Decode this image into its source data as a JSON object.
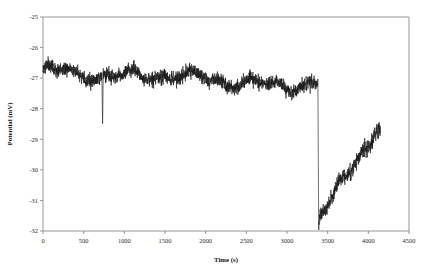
{
  "chart_data": {
    "type": "line",
    "title": "",
    "xlabel": "Time (s)",
    "ylabel": "Potential (mV)",
    "xlim": [
      0,
      4500
    ],
    "ylim": [
      -32,
      -25
    ],
    "xticks": [
      0,
      500,
      1000,
      1500,
      2000,
      2500,
      3000,
      3500,
      4000,
      4500
    ],
    "yticks": [
      -25,
      -26,
      -27,
      -28,
      -29,
      -30,
      -31,
      -32
    ],
    "xtick_labels": [
      "0",
      "500",
      "1000",
      "1500",
      "2000",
      "2500",
      "3000",
      "3500",
      "4000",
      "4500"
    ],
    "ytick_labels": [
      "-25",
      "-26",
      "-27",
      "-28",
      "-29",
      "-30",
      "-31",
      "-32"
    ],
    "grid": false,
    "legend": null,
    "legend_position": "none",
    "series": [
      {
        "name": "Potential",
        "color": "#1a1a1a",
        "x_start": 0,
        "x_end": 4150,
        "description": "Open-circuit potential transient: noisy plateau near -27 mV with a sharp negative excursion near 730 s, a vertical drop to -32 mV at about 3380 s, followed by a noisy recovery toward -28.7 mV.",
        "segments": [
          {
            "name": "initial-plateau",
            "x_range": [
              0,
              3380
            ],
            "baseline_start": -26.75,
            "baseline_end": -27.25,
            "noise_amplitude": 0.22,
            "comment": "Dense high-frequency noise band drifting slowly downward"
          },
          {
            "name": "negative-spike",
            "x_range": [
              725,
              740
            ],
            "peak_value": -28.55,
            "comment": "Single sharp downward transient"
          },
          {
            "name": "vertical-drop",
            "x_range": [
              3380,
              3390
            ],
            "from_value": -27.2,
            "to_value": -32.0,
            "comment": "Near-instantaneous cliff to the bottom of the axis"
          },
          {
            "name": "recovery",
            "x_range": [
              3390,
              4150
            ],
            "baseline_start": -31.6,
            "baseline_end": -28.7,
            "noise_amplitude": 0.25,
            "comment": "Logarithmic-like noisy rise"
          }
        ],
        "key_points": [
          {
            "x": 0,
            "y": -26.8
          },
          {
            "x": 100,
            "y": -26.7
          },
          {
            "x": 250,
            "y": -26.95
          },
          {
            "x": 400,
            "y": -26.85
          },
          {
            "x": 550,
            "y": -26.95
          },
          {
            "x": 730,
            "y": -28.55
          },
          {
            "x": 760,
            "y": -27.0
          },
          {
            "x": 900,
            "y": -27.0
          },
          {
            "x": 1100,
            "y": -26.95
          },
          {
            "x": 1400,
            "y": -27.05
          },
          {
            "x": 1700,
            "y": -27.0
          },
          {
            "x": 2000,
            "y": -27.1
          },
          {
            "x": 2300,
            "y": -27.1
          },
          {
            "x": 2600,
            "y": -27.15
          },
          {
            "x": 2900,
            "y": -27.15
          },
          {
            "x": 3200,
            "y": -27.2
          },
          {
            "x": 3375,
            "y": -27.2
          },
          {
            "x": 3385,
            "y": -32.0
          },
          {
            "x": 3400,
            "y": -31.6
          },
          {
            "x": 3450,
            "y": -31.35
          },
          {
            "x": 3500,
            "y": -31.1
          },
          {
            "x": 3600,
            "y": -30.7
          },
          {
            "x": 3700,
            "y": -30.3
          },
          {
            "x": 3800,
            "y": -29.9
          },
          {
            "x": 3900,
            "y": -29.5
          },
          {
            "x": 4000,
            "y": -29.1
          },
          {
            "x": 4100,
            "y": -28.8
          },
          {
            "x": 4150,
            "y": -28.7
          }
        ]
      }
    ]
  },
  "figure": {
    "plot_area": {
      "left": 43,
      "top": 17,
      "right": 409,
      "bottom": 231
    }
  }
}
